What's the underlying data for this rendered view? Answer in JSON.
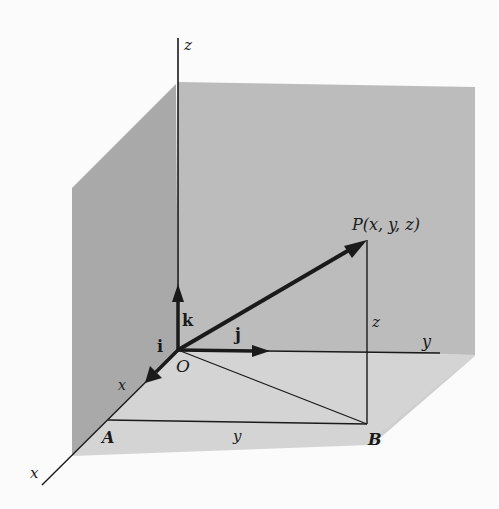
{
  "diagram": {
    "colors": {
      "background": "#fbfbfb",
      "back_wall": "#bdbdbd",
      "left_wall": "#a8a8a8",
      "floor": "#d6d6d6",
      "lines": "#1a1a1a"
    },
    "axes": {
      "x_label": "x",
      "y_label": "y",
      "z_label": "z"
    },
    "origin_label": "O",
    "unit_vectors": {
      "i": "i",
      "j": "j",
      "k": "k"
    },
    "point_P_label": "P(x, y, z)",
    "point_A_label": "A",
    "point_B_label": "B",
    "segment_labels": {
      "OA_x": "x",
      "AB_y": "y",
      "BP_z": "z"
    }
  }
}
